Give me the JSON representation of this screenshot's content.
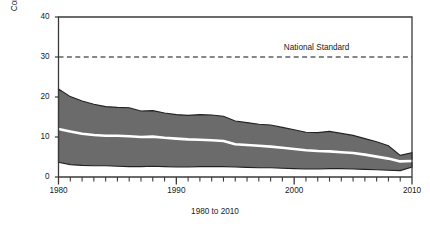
{
  "chart_data": {
    "type": "area",
    "title": "",
    "subtitle": "",
    "xlabel": "1980 to 2010",
    "ylabel": "Concentration ppb",
    "xlim": [
      1980,
      2010
    ],
    "ylim": [
      0,
      40
    ],
    "yticks": [
      0,
      10,
      20,
      30,
      40
    ],
    "ytick_labels": [
      "0",
      "10",
      "20",
      "30",
      "40"
    ],
    "xticks": [
      1980,
      1981,
      1982,
      1983,
      1984,
      1985,
      1986,
      1987,
      1988,
      1989,
      1990,
      1991,
      1992,
      1993,
      1994,
      1995,
      1996,
      1997,
      1998,
      1999,
      2000,
      2001,
      2002,
      2003,
      2004,
      2005,
      2006,
      2007,
      2008,
      2009,
      2010
    ],
    "xtick_labels_major": [
      "1980",
      "1990",
      "2000",
      "2010"
    ],
    "xticks_major": [
      1980,
      1990,
      2000,
      2010
    ],
    "grid": false,
    "legend_position": "none",
    "fill_color": "#6b6b6b",
    "band_edge_color": "#222222",
    "median_color": "#ffffff",
    "axis_color": "#3a3a3a",
    "annotations": [
      {
        "text": "National Standard",
        "x": 2003.2,
        "y": 32.0,
        "kind": "threshold-label"
      }
    ],
    "threshold": {
      "label": "National Standard",
      "value": 30,
      "style": "dashed",
      "color": "#111111"
    },
    "x": [
      1980,
      1981,
      1982,
      1983,
      1984,
      1985,
      1986,
      1987,
      1988,
      1989,
      1990,
      1991,
      1992,
      1993,
      1994,
      1995,
      1996,
      1997,
      1998,
      1999,
      2000,
      2001,
      2002,
      2003,
      2004,
      2005,
      2006,
      2007,
      2008,
      2009,
      2010
    ],
    "series": [
      {
        "name": "90th Percentile",
        "role": "band-upper",
        "values": [
          22.0,
          20.1,
          19.0,
          18.2,
          17.6,
          17.4,
          17.3,
          16.5,
          16.6,
          16.0,
          15.6,
          15.4,
          15.6,
          15.5,
          15.2,
          14.0,
          13.6,
          13.2,
          13.0,
          12.4,
          11.8,
          11.2,
          11.1,
          11.4,
          10.9,
          10.4,
          9.6,
          8.8,
          7.8,
          5.4,
          6.1
        ]
      },
      {
        "name": "Median",
        "role": "band-median",
        "values": [
          12.0,
          11.4,
          10.8,
          10.5,
          10.3,
          10.3,
          10.2,
          10.0,
          10.1,
          9.8,
          9.6,
          9.4,
          9.3,
          9.2,
          9.0,
          8.2,
          8.0,
          7.8,
          7.6,
          7.3,
          7.0,
          6.7,
          6.5,
          6.4,
          6.2,
          6.0,
          5.6,
          5.1,
          4.6,
          3.9,
          4.0
        ]
      },
      {
        "name": "10th Percentile",
        "role": "band-lower",
        "values": [
          3.7,
          3.1,
          2.9,
          2.8,
          2.8,
          2.7,
          2.6,
          2.6,
          2.7,
          2.6,
          2.5,
          2.5,
          2.6,
          2.6,
          2.6,
          2.5,
          2.4,
          2.3,
          2.3,
          2.2,
          2.1,
          2.0,
          2.0,
          2.1,
          2.1,
          2.0,
          1.9,
          1.8,
          1.7,
          1.6,
          2.5
        ]
      }
    ]
  }
}
